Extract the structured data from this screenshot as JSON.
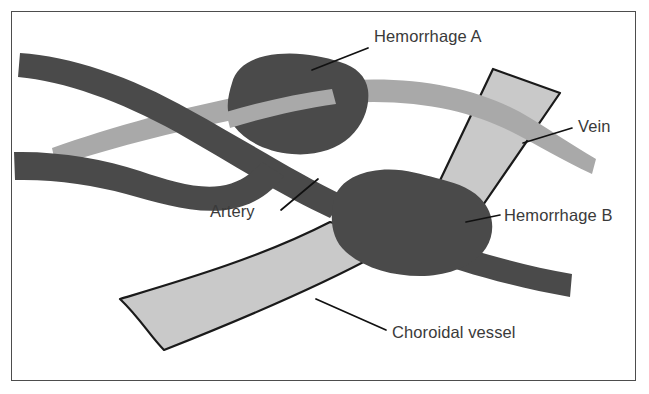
{
  "figure": {
    "kind": "anatomical-diagram",
    "background_color": "#ffffff",
    "frame_color": "#4d4d4d"
  },
  "palette": {
    "artery_fill": "#4a4a4a",
    "hemorrhage_fill": "#4a4a4a",
    "vein_fill": "#a9a9a9",
    "choroidal_fill": "#c9c9c9",
    "choroidal_outline": "#1a1a1a",
    "label_color": "#3a3a3a",
    "leader_color": "#111111"
  },
  "structures": [
    {
      "id": "artery",
      "name": "Artery",
      "fill": "#4a4a4a",
      "outlined": false
    },
    {
      "id": "vein",
      "name": "Vein",
      "fill": "#a9a9a9",
      "outlined": false
    },
    {
      "id": "choroidal-vessel",
      "name": "Choroidal vessel",
      "fill": "#c9c9c9",
      "outlined": true
    },
    {
      "id": "hemorrhage-a",
      "name": "Hemorrhage A",
      "fill": "#4a4a4a",
      "outlined": false
    },
    {
      "id": "hemorrhage-b",
      "name": "Hemorrhage B",
      "fill": "#4a4a4a",
      "outlined": false
    }
  ],
  "annotations": {
    "hemorrhage_a": {
      "label": "Hemorrhage A",
      "text_x": 374,
      "text_y": 42,
      "leader": "M 368 48 L 312 70"
    },
    "vein": {
      "label": "Vein",
      "text_x": 578,
      "text_y": 132,
      "leader": "M 572 128 L 523 143"
    },
    "artery": {
      "label": "Artery",
      "text_x": 210,
      "text_y": 217,
      "leader": "M 281 210 L 318 179"
    },
    "hemorrhage_b": {
      "label": "Hemorrhage B",
      "text_x": 504,
      "text_y": 221,
      "leader": "M 500 215 L 466 222"
    },
    "choroidal_vessel": {
      "label": "Choroidal vessel",
      "text_x": 392,
      "text_y": 338,
      "leader": "M 386 330 L 316 299"
    }
  }
}
